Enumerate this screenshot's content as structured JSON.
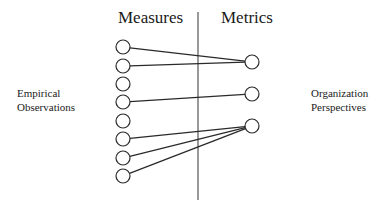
{
  "diagram": {
    "headings": {
      "left": "Measures",
      "right": "Metrics"
    },
    "side_labels": {
      "left": [
        "Empirical",
        "Observations"
      ],
      "right": [
        "Organization",
        "Perspectives"
      ]
    },
    "divider": {
      "x": 198,
      "y1": 12,
      "y2": 200
    },
    "measures": [
      {
        "id": "m1",
        "cx": 123,
        "cy": 47
      },
      {
        "id": "m2",
        "cx": 123,
        "cy": 66
      },
      {
        "id": "m3",
        "cx": 123,
        "cy": 84
      },
      {
        "id": "m4",
        "cx": 123,
        "cy": 102
      },
      {
        "id": "m5",
        "cx": 123,
        "cy": 121
      },
      {
        "id": "m6",
        "cx": 123,
        "cy": 139
      },
      {
        "id": "m7",
        "cx": 123,
        "cy": 158
      },
      {
        "id": "m8",
        "cx": 123,
        "cy": 176
      }
    ],
    "metrics": [
      {
        "id": "k1",
        "cx": 252,
        "cy": 62
      },
      {
        "id": "k2",
        "cx": 252,
        "cy": 94
      },
      {
        "id": "k3",
        "cx": 252,
        "cy": 126
      }
    ],
    "connections": [
      {
        "from": "m1",
        "to": "k1"
      },
      {
        "from": "m2",
        "to": "k1"
      },
      {
        "from": "m4",
        "to": "k2"
      },
      {
        "from": "m6",
        "to": "k3"
      },
      {
        "from": "m7",
        "to": "k3"
      },
      {
        "from": "m8",
        "to": "k3"
      }
    ],
    "circle_radius": 7,
    "stroke_color": "#2a2a2a",
    "divider_color": "#555555"
  }
}
